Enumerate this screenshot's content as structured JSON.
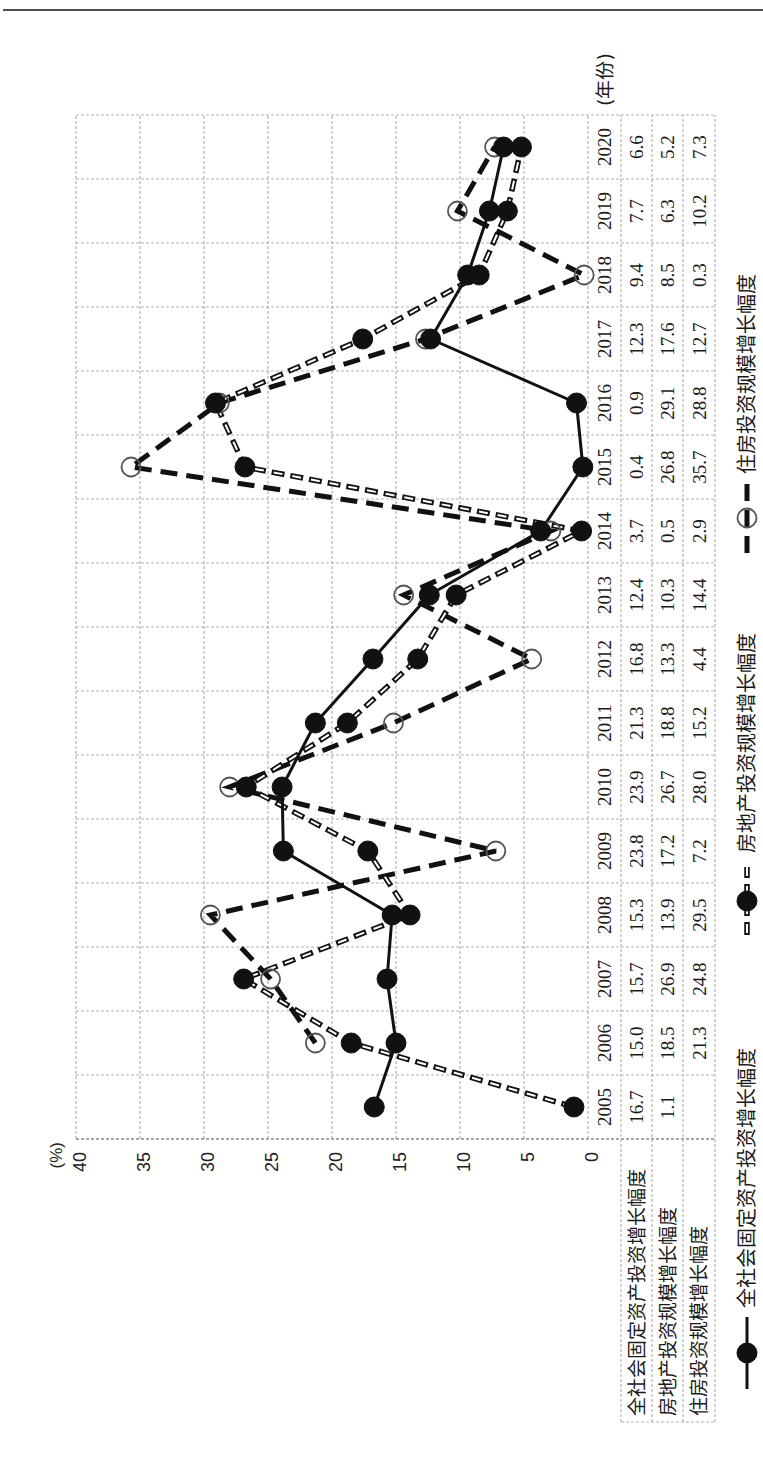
{
  "chart_data": {
    "type": "line",
    "title": "",
    "xlabel": "(年份)",
    "ylabel": "(%)",
    "orientation": "rotated-90-ccw",
    "grid": true,
    "legend_position": "bottom",
    "ylim": [
      0,
      40
    ],
    "y_ticks": [
      0,
      5,
      10,
      15,
      20,
      25,
      30,
      35,
      40
    ],
    "categories": [
      "2005",
      "2006",
      "2007",
      "2008",
      "2009",
      "2010",
      "2011",
      "2012",
      "2013",
      "2014",
      "2015",
      "2016",
      "2017",
      "2018",
      "2019",
      "2020"
    ],
    "series": [
      {
        "name": "全社会固定资产投资增长幅度",
        "line_style": "solid",
        "marker": "filled-circle",
        "color": "#111111",
        "values": [
          16.7,
          15.0,
          15.7,
          15.3,
          23.8,
          23.9,
          21.3,
          16.8,
          12.4,
          3.7,
          0.4,
          0.9,
          12.3,
          9.4,
          7.7,
          6.6
        ]
      },
      {
        "name": "房地产投资规模增长幅度",
        "line_style": "hollow-dash",
        "marker": "filled-circle",
        "color": "#111111",
        "values": [
          1.1,
          18.5,
          26.9,
          13.9,
          17.2,
          26.7,
          18.8,
          13.3,
          10.3,
          0.5,
          26.8,
          29.1,
          17.6,
          8.5,
          6.3,
          5.2
        ]
      },
      {
        "name": "住房投资规模增长幅度",
        "line_style": "thick-dash",
        "marker": "open-circle",
        "color": "#111111",
        "values": [
          null,
          21.3,
          24.8,
          29.5,
          7.2,
          28.0,
          15.2,
          4.4,
          14.4,
          2.9,
          35.7,
          28.8,
          12.7,
          0.3,
          10.2,
          7.3
        ]
      }
    ],
    "table": {
      "rows": [
        {
          "label": "全社会固定资产投资增长幅度",
          "cells": [
            "16.7",
            "15.0",
            "15.7",
            "15.3",
            "23.8",
            "23.9",
            "21.3",
            "16.8",
            "12.4",
            "3.7",
            "0.4",
            "0.9",
            "12.3",
            "9.4",
            "7.7",
            "6.6"
          ]
        },
        {
          "label": "房地产投资规模增长幅度",
          "cells": [
            "1.1",
            "18.5",
            "26.9",
            "13.9",
            "17.2",
            "26.7",
            "18.8",
            "13.3",
            "10.3",
            "0.5",
            "26.8",
            "29.1",
            "17.6",
            "8.5",
            "6.3",
            "5.2"
          ]
        },
        {
          "label": "住房投资规模增长幅度",
          "cells": [
            "",
            "21.3",
            "24.8",
            "29.5",
            "7.2",
            "28.0",
            "15.2",
            "4.4",
            "14.4",
            "2.9",
            "35.7",
            "28.8",
            "12.7",
            "0.3",
            "10.2",
            "7.3"
          ]
        }
      ]
    }
  },
  "colors": {
    "ink": "#111111",
    "grid": "#b3b3b3",
    "page_rule": "#4d4d4d",
    "background": "#ffffff"
  }
}
